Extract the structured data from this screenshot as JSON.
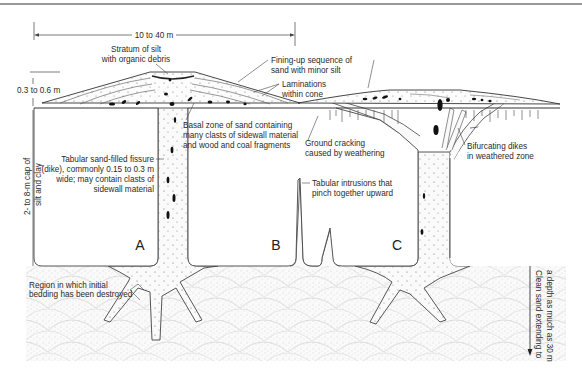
{
  "diagram": {
    "type": "geologic cross-section of sand blows and dikes",
    "dimensions": {
      "width_label": "10 to 40 m",
      "cone_thickness_label": "0.3 to 0.6 m",
      "cap_thickness_label_line1": "2- to 8-m cap of",
      "cap_thickness_label_line2": "silt and clay",
      "sand_depth_label_line1": "Clean sand extending to",
      "sand_depth_label_line2": "a depth as much as 30 m"
    },
    "annotations": {
      "stratum_silt": [
        "Stratum of silt",
        "with organic debris"
      ],
      "fining_up": [
        "Fining-up sequence of",
        "sand with minor silt"
      ],
      "laminations": [
        "Laminations",
        "within cone"
      ],
      "basal_zone": [
        "Basal zone of sand containing",
        "many clasts of sidewall material",
        "and wood and coal fragments"
      ],
      "tabular_fissure": [
        "Tabular sand-filled fissure",
        "(dike), commonly 0.15 to 0.3 m",
        "wide; may contain clasts of",
        "sidewall material"
      ],
      "ground_cracking": [
        "Ground cracking",
        "caused by weathering"
      ],
      "bifurcating_dikes": [
        "Bifurcating dikes",
        "in weathered zone"
      ],
      "tabular_intrusions": [
        "Tabular intrusions that",
        "pinch together upward"
      ],
      "region_bedding": [
        "Region in which initial",
        "bedding has been destroyed"
      ]
    },
    "dike_labels": {
      "a": "A",
      "b": "B",
      "c": "C"
    }
  }
}
